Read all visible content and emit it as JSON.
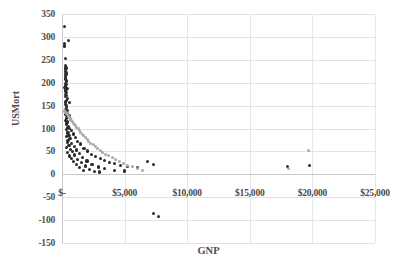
{
  "chart_data": {
    "type": "scatter",
    "title": "",
    "xlabel": "GNP",
    "ylabel": "USMort",
    "xlim": [
      0,
      25000
    ],
    "ylim": [
      -150,
      350
    ],
    "grid": true,
    "legend": "none",
    "x_tick_labels": [
      "$-",
      "$5,000",
      "$10,000",
      "$15,000",
      "$20,000",
      "$25,000"
    ],
    "x_tick_values": [
      0,
      5000,
      10000,
      15000,
      20000,
      25000
    ],
    "y_tick_labels": [
      "350",
      "300",
      "250",
      "200",
      "150",
      "100",
      "50",
      "0",
      "-50",
      "-100",
      "-150"
    ],
    "y_tick_values": [
      350,
      300,
      250,
      200,
      150,
      100,
      50,
      0,
      -50,
      -100,
      -150
    ],
    "series": [
      {
        "name": "observed",
        "color": "#2b2b2b",
        "marker": "circle",
        "points": [
          [
            230,
            322
          ],
          [
            500,
            292
          ],
          [
            210,
            285
          ],
          [
            200,
            280
          ],
          [
            260,
            252
          ],
          [
            300,
            238
          ],
          [
            320,
            232
          ],
          [
            250,
            228
          ],
          [
            300,
            225
          ],
          [
            340,
            222
          ],
          [
            280,
            220
          ],
          [
            360,
            218
          ],
          [
            260,
            215
          ],
          [
            300,
            212
          ],
          [
            250,
            208
          ],
          [
            390,
            205
          ],
          [
            330,
            202
          ],
          [
            280,
            198
          ],
          [
            350,
            196
          ],
          [
            300,
            193
          ],
          [
            240,
            190
          ],
          [
            410,
            188
          ],
          [
            320,
            185
          ],
          [
            290,
            182
          ],
          [
            360,
            178
          ],
          [
            270,
            175
          ],
          [
            330,
            172
          ],
          [
            300,
            170
          ],
          [
            430,
            166
          ],
          [
            350,
            162
          ],
          [
            280,
            158
          ],
          [
            620,
            156
          ],
          [
            310,
            152
          ],
          [
            380,
            150
          ],
          [
            340,
            146
          ],
          [
            300,
            142
          ],
          [
            470,
            140
          ],
          [
            360,
            136
          ],
          [
            410,
            133
          ],
          [
            320,
            130
          ],
          [
            560,
            128
          ],
          [
            390,
            124
          ],
          [
            340,
            121
          ],
          [
            700,
            119
          ],
          [
            300,
            117
          ],
          [
            450,
            114
          ],
          [
            380,
            112
          ],
          [
            330,
            108
          ],
          [
            520,
            105
          ],
          [
            420,
            103
          ],
          [
            600,
            100
          ],
          [
            360,
            98
          ],
          [
            780,
            96
          ],
          [
            480,
            92
          ],
          [
            410,
            90
          ],
          [
            900,
            88
          ],
          [
            560,
            85
          ],
          [
            340,
            83
          ],
          [
            1050,
            80
          ],
          [
            640,
            78
          ],
          [
            480,
            74
          ],
          [
            1250,
            72
          ],
          [
            420,
            70
          ],
          [
            760,
            68
          ],
          [
            1500,
            66
          ],
          [
            560,
            62
          ],
          [
            980,
            60
          ],
          [
            380,
            58
          ],
          [
            1750,
            57
          ],
          [
            680,
            55
          ],
          [
            1150,
            53
          ],
          [
            2050,
            51
          ],
          [
            830,
            49
          ],
          [
            460,
            47
          ],
          [
            1400,
            45
          ],
          [
            2350,
            44
          ],
          [
            1000,
            42
          ],
          [
            620,
            40
          ],
          [
            2700,
            39
          ],
          [
            1650,
            37
          ],
          [
            780,
            35
          ],
          [
            3050,
            34
          ],
          [
            1250,
            32
          ],
          [
            3400,
            31
          ],
          [
            2000,
            29
          ],
          [
            950,
            28
          ],
          [
            3800,
            26
          ],
          [
            1550,
            25
          ],
          [
            4200,
            24
          ],
          [
            2400,
            22
          ],
          [
            1150,
            21
          ],
          [
            4700,
            20
          ],
          [
            1900,
            18
          ],
          [
            5200,
            17
          ],
          [
            2900,
            16
          ],
          [
            6000,
            15
          ],
          [
            1400,
            14
          ],
          [
            3400,
            12
          ],
          [
            6800,
            28
          ],
          [
            7300,
            22
          ],
          [
            2200,
            10
          ],
          [
            4200,
            9
          ],
          [
            1700,
            8
          ],
          [
            5000,
            7
          ],
          [
            18000,
            17
          ],
          [
            19800,
            20
          ],
          [
            2600,
            6
          ],
          [
            3000,
            5
          ],
          [
            7300,
            -85
          ],
          [
            7700,
            -92
          ]
        ]
      },
      {
        "name": "fitted",
        "color": "#a9a9ad",
        "marker": "circle",
        "points": [
          [
            180,
            140
          ],
          [
            230,
            138
          ],
          [
            280,
            136
          ],
          [
            330,
            134
          ],
          [
            380,
            132
          ],
          [
            430,
            130
          ],
          [
            480,
            128
          ],
          [
            530,
            126
          ],
          [
            590,
            124
          ],
          [
            650,
            122
          ],
          [
            710,
            120
          ],
          [
            780,
            118
          ],
          [
            850,
            115
          ],
          [
            920,
            112
          ],
          [
            1000,
            109
          ],
          [
            1090,
            106
          ],
          [
            1180,
            103
          ],
          [
            1280,
            100
          ],
          [
            1380,
            96
          ],
          [
            1490,
            92
          ],
          [
            1610,
            88
          ],
          [
            1730,
            84
          ],
          [
            1860,
            80
          ],
          [
            2000,
            76
          ],
          [
            2150,
            72
          ],
          [
            2310,
            68
          ],
          [
            2480,
            64
          ],
          [
            2660,
            60
          ],
          [
            2850,
            56
          ],
          [
            3050,
            52
          ],
          [
            3270,
            48
          ],
          [
            3500,
            44
          ],
          [
            3750,
            40
          ],
          [
            4010,
            36
          ],
          [
            4290,
            32
          ],
          [
            4590,
            28
          ],
          [
            4910,
            24
          ],
          [
            5250,
            20
          ],
          [
            5620,
            16
          ],
          [
            6010,
            12
          ],
          [
            6430,
            9
          ],
          [
            18100,
            12
          ],
          [
            19700,
            52
          ]
        ]
      }
    ]
  },
  "axes": {
    "y_title": "USMort",
    "x_title": "GNP"
  }
}
